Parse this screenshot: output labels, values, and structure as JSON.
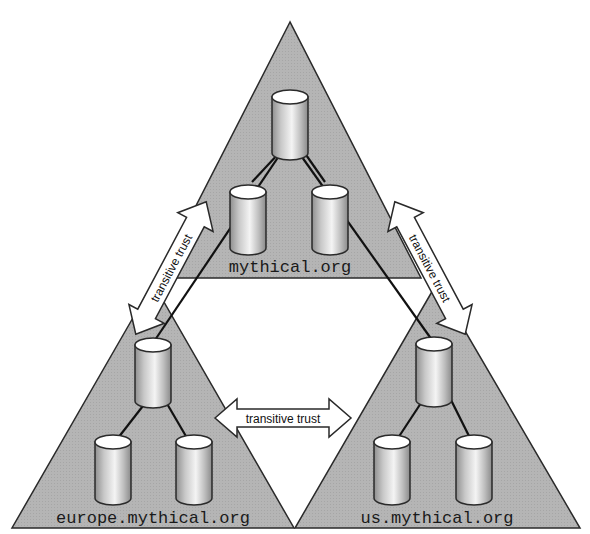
{
  "diagram": {
    "type": "domain-trust-tree",
    "colors": {
      "triangle_fill": "#b3b3b3",
      "outline": "#2a2a2a",
      "background": "#ffffff",
      "arrow_fill": "#ffffff"
    },
    "domains": [
      {
        "id": "root",
        "label": "mythical.org"
      },
      {
        "id": "europe",
        "label": "europe.mythical.org"
      },
      {
        "id": "us",
        "label": "us.mythical.org"
      }
    ],
    "trusts": [
      {
        "from": "root",
        "to": "europe",
        "label": "transitive trust"
      },
      {
        "from": "root",
        "to": "us",
        "label": "transitive trust"
      },
      {
        "from": "europe",
        "to": "us",
        "label": "transitive trust"
      }
    ]
  }
}
